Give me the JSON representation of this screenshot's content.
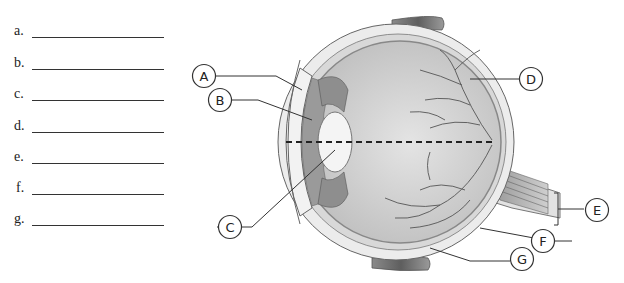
{
  "worksheet": {
    "answer_blanks": [
      {
        "letter": "a.",
        "value": ""
      },
      {
        "letter": "b.",
        "value": ""
      },
      {
        "letter": "c.",
        "value": ""
      },
      {
        "letter": "d.",
        "value": ""
      },
      {
        "letter": "e.",
        "value": ""
      },
      {
        "letter": "f.",
        "value": ""
      },
      {
        "letter": "g.",
        "value": ""
      }
    ]
  },
  "diagram": {
    "labels": [
      "A",
      "B",
      "C",
      "D",
      "E",
      "F",
      "G"
    ],
    "colors": {
      "line": "#333333",
      "sclera": "#e6e6e6",
      "interior": "#cfcfcf",
      "muscle": "#6f6f6f",
      "vessel": "#555555"
    }
  }
}
